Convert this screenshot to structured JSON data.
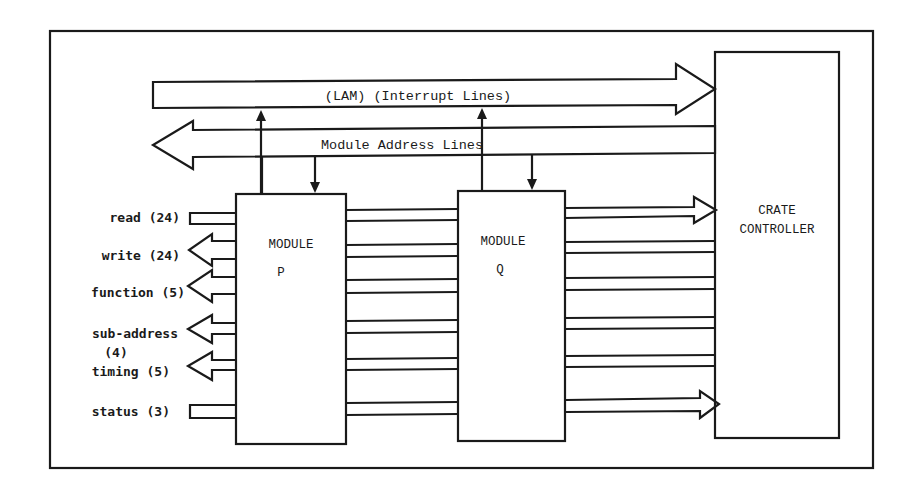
{
  "diagram": {
    "buses": {
      "lam": {
        "label": "(LAM) (Interrupt Lines)",
        "direction": "to-controller"
      },
      "address": {
        "label": "Module Address Lines",
        "direction": "from-controller"
      }
    },
    "modules": [
      {
        "id": "P",
        "title": "MODULE",
        "name": "P"
      },
      {
        "id": "Q",
        "title": "MODULE",
        "name": "Q"
      }
    ],
    "controller": {
      "line1": "CRATE",
      "line2": "CONTROLLER"
    },
    "signals": [
      {
        "label": "read (24)",
        "direction": "into-module"
      },
      {
        "label": "write (24)",
        "direction": "out-of-module"
      },
      {
        "label": "function (5)",
        "direction": "out-of-module"
      },
      {
        "label": "sub-address",
        "label2": "(4)",
        "direction": "out-of-module"
      },
      {
        "label": "timing (5)",
        "direction": "out-of-module"
      },
      {
        "label": "status (3)",
        "direction": "into-module"
      }
    ]
  }
}
